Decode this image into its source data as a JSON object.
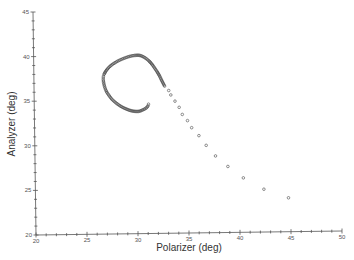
{
  "chart_data": {
    "type": "scatter",
    "title": "",
    "xlabel": "Polarizer (deg)",
    "ylabel": "Analyzer (deg)",
    "xlim": [
      20,
      50
    ],
    "ylim": [
      20,
      45
    ],
    "xticks": [
      20,
      25,
      30,
      35,
      40,
      45,
      50
    ],
    "yticks": [
      20,
      25,
      30,
      35,
      40,
      45
    ],
    "minor_tick_step": 1,
    "grid": false,
    "legend": null,
    "marker": "open-circle",
    "series": [
      {
        "name": "trajectory",
        "points": [
          [
            31.2,
            34.5
          ],
          [
            31.15,
            34.3
          ],
          [
            31.0,
            34.1
          ],
          [
            30.8,
            33.95
          ],
          [
            30.6,
            33.85
          ],
          [
            30.4,
            33.75
          ],
          [
            30.2,
            33.7
          ],
          [
            30.0,
            33.7
          ],
          [
            29.8,
            33.72
          ],
          [
            29.6,
            33.76
          ],
          [
            29.4,
            33.82
          ],
          [
            29.2,
            33.9
          ],
          [
            29.0,
            34.0
          ],
          [
            28.8,
            34.1
          ],
          [
            28.6,
            34.22
          ],
          [
            28.4,
            34.36
          ],
          [
            28.2,
            34.52
          ],
          [
            28.0,
            34.7
          ],
          [
            27.8,
            34.9
          ],
          [
            27.6,
            35.12
          ],
          [
            27.45,
            35.35
          ],
          [
            27.3,
            35.6
          ],
          [
            27.15,
            35.85
          ],
          [
            27.05,
            36.1
          ],
          [
            26.95,
            36.4
          ],
          [
            26.88,
            36.7
          ],
          [
            26.83,
            37.0
          ],
          [
            26.8,
            37.3
          ],
          [
            26.8,
            37.5
          ],
          [
            26.82,
            37.7
          ],
          [
            26.88,
            37.9
          ],
          [
            26.97,
            38.1
          ],
          [
            27.08,
            38.3
          ],
          [
            27.22,
            38.5
          ],
          [
            27.38,
            38.7
          ],
          [
            27.56,
            38.88
          ],
          [
            27.76,
            39.05
          ],
          [
            27.98,
            39.2
          ],
          [
            28.2,
            39.35
          ],
          [
            28.44,
            39.48
          ],
          [
            28.68,
            39.6
          ],
          [
            28.92,
            39.7
          ],
          [
            29.16,
            39.8
          ],
          [
            29.4,
            39.88
          ],
          [
            29.64,
            39.94
          ],
          [
            29.88,
            39.98
          ],
          [
            30.1,
            40.0
          ],
          [
            30.3,
            40.0
          ],
          [
            30.5,
            39.95
          ],
          [
            30.7,
            39.85
          ],
          [
            30.9,
            39.72
          ],
          [
            31.1,
            39.55
          ],
          [
            31.3,
            39.35
          ],
          [
            31.5,
            39.1
          ],
          [
            31.7,
            38.8
          ],
          [
            31.9,
            38.45
          ],
          [
            32.1,
            38.1
          ],
          [
            32.3,
            37.7
          ],
          [
            32.5,
            37.2
          ],
          [
            32.8,
            36.5
          ],
          [
            33.2,
            36.0
          ],
          [
            33.4,
            35.5
          ],
          [
            33.8,
            34.8
          ],
          [
            34.2,
            34.1
          ],
          [
            34.5,
            33.3
          ],
          [
            35.0,
            32.6
          ],
          [
            35.4,
            31.8
          ],
          [
            36.1,
            30.9
          ],
          [
            36.8,
            29.8
          ],
          [
            37.7,
            28.6
          ],
          [
            38.9,
            27.4
          ],
          [
            40.4,
            26.1
          ],
          [
            42.4,
            24.8
          ],
          [
            44.8,
            23.8
          ]
        ]
      }
    ]
  },
  "axes": {
    "x_title": "Polarizer (deg)",
    "y_title": "Analyzer (deg)",
    "x_tick_labels": [
      "20",
      "25",
      "30",
      "35",
      "40",
      "45",
      "50"
    ],
    "y_tick_labels": [
      "20",
      "25",
      "30",
      "35",
      "40",
      "45"
    ]
  },
  "colors": {
    "axis": "#555555",
    "marker_stroke": "#444444",
    "text": "#333333"
  }
}
